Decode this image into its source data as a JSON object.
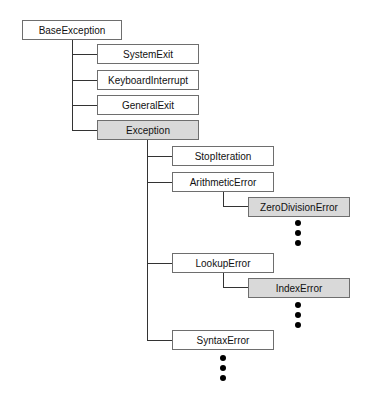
{
  "diagram": {
    "colors": {
      "box_fill": "#ffffff",
      "highlight_fill": "#d9d9d9",
      "border": "#6e6e6e",
      "line": "#333333"
    },
    "nodes": [
      {
        "id": "base",
        "label": "BaseException",
        "highlighted": false
      },
      {
        "id": "sysexit",
        "label": "SystemExit",
        "highlighted": false
      },
      {
        "id": "kbint",
        "label": "KeyboardInterrupt",
        "highlighted": false
      },
      {
        "id": "genexit",
        "label": "GeneralExit",
        "highlighted": false
      },
      {
        "id": "exception",
        "label": "Exception",
        "highlighted": true
      },
      {
        "id": "stopiter",
        "label": "StopIteration",
        "highlighted": false
      },
      {
        "id": "arith",
        "label": "ArithmeticError",
        "highlighted": false
      },
      {
        "id": "zerodiv",
        "label": "ZeroDivisionError",
        "highlighted": true
      },
      {
        "id": "lookup",
        "label": "LookupError",
        "highlighted": false
      },
      {
        "id": "index",
        "label": "IndexError",
        "highlighted": true
      },
      {
        "id": "syntax",
        "label": "SyntaxError",
        "highlighted": false
      }
    ],
    "edges": [
      [
        "base",
        "sysexit"
      ],
      [
        "base",
        "kbint"
      ],
      [
        "base",
        "genexit"
      ],
      [
        "base",
        "exception"
      ],
      [
        "exception",
        "stopiter"
      ],
      [
        "exception",
        "arith"
      ],
      [
        "exception",
        "lookup"
      ],
      [
        "exception",
        "syntax"
      ],
      [
        "arith",
        "zerodiv"
      ],
      [
        "lookup",
        "index"
      ]
    ],
    "ellipses": [
      "below ZeroDivisionError",
      "below IndexError",
      "below SyntaxError"
    ]
  }
}
